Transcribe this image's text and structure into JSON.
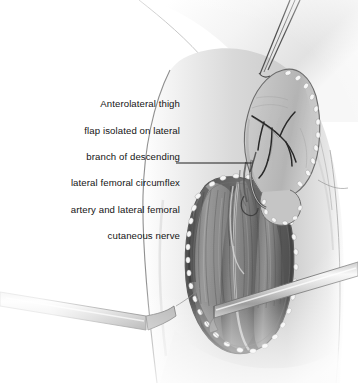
{
  "figure": {
    "name": "anterolateral-thigh-flap-illustration",
    "medium": "grayscale medical line-and-tone illustration",
    "background_color": "#ffffff",
    "width": 358,
    "height": 383
  },
  "caption": {
    "alignment": "right",
    "text": "Anterolateral thigh flap isolated on lateral branch of descending lateral femoral circumflex artery and lateral femoral cutaneous nerve",
    "lines": [
      "Anterolateral thigh",
      "flap isolated on lateral",
      "branch of descending",
      "lateral femoral circumflex",
      "artery and lateral femoral",
      "cutaneous nerve"
    ]
  },
  "leader_line": {
    "label": "leader-line-to-vascular-pedicle",
    "from_x": 176,
    "from_y": 163,
    "to_x": 252,
    "to_y": 163,
    "color": "#1e1e1e",
    "width": 1
  },
  "anatomy": {
    "thigh_label": "right thigh, anterolateral view",
    "skin_tone": "#d8d8d8",
    "wound_outline_color": "#5a5a5a",
    "structures": [
      {
        "name": "skin-flap-paddle",
        "description": "elevated anterolateral thigh skin and fat flap reflected superiorly"
      },
      {
        "name": "subcutaneous-fat-border",
        "description": "stippled beaded fat margin along flap and wound edges",
        "color": "#f2f2f2"
      },
      {
        "name": "perforator-vessels",
        "description": "branching perforating vessels on flap undersurface",
        "color": "#2b2b2b"
      },
      {
        "name": "vascular-pedicle",
        "description": "descending branch of lateral femoral circumflex artery with accompanying nerve"
      },
      {
        "name": "rectus-femoris-muscle",
        "description": "medial muscle belly in the open wound",
        "color": "#8e8e8e"
      },
      {
        "name": "vastus-lateralis-muscle",
        "description": "lateral muscle belly in the open wound",
        "color": "#7c7c7c"
      },
      {
        "name": "intermuscular-septum",
        "description": "pale septal plane between muscle bellies"
      }
    ],
    "instruments": [
      {
        "name": "forceps",
        "description": "fine two-pronged forceps grasping the flap tip from upper right"
      },
      {
        "name": "retractor-upper-right",
        "description": "flat metal retractor blade crossing the wound to the right"
      },
      {
        "name": "retractor-lower-left",
        "description": "flat metal retractor blade crossing the wound to the left"
      }
    ]
  }
}
